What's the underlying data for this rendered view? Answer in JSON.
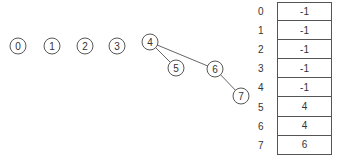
{
  "tree": {
    "nodes": [
      {
        "id": "0",
        "x": 18,
        "y": 46
      },
      {
        "id": "1",
        "x": 52,
        "y": 46
      },
      {
        "id": "2",
        "x": 85,
        "y": 46
      },
      {
        "id": "3",
        "x": 117,
        "y": 46
      },
      {
        "id": "4",
        "x": 150,
        "y": 42
      },
      {
        "id": "5",
        "x": 176,
        "y": 68
      },
      {
        "id": "6",
        "x": 215,
        "y": 69
      },
      {
        "id": "7",
        "x": 241,
        "y": 96
      }
    ],
    "edges": [
      [
        "4",
        "5"
      ],
      [
        "4",
        "6"
      ],
      [
        "6",
        "7"
      ]
    ]
  },
  "parent_array": {
    "indices": [
      "0",
      "1",
      "2",
      "3",
      "4",
      "5",
      "6",
      "7"
    ],
    "values": [
      "-1",
      "-1",
      "-1",
      "-1",
      "-1",
      "4",
      "4",
      "6"
    ]
  }
}
